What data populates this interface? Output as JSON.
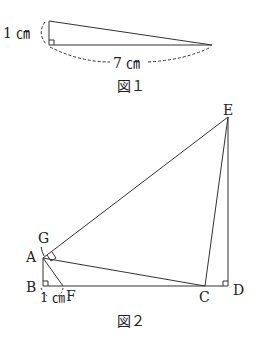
{
  "figure1": {
    "caption": "図１",
    "height_label": "1 ㎝",
    "base_label": "7 ㎝"
  },
  "figure2": {
    "caption": "図２",
    "points": {
      "A": "A",
      "B": "B",
      "C": "C",
      "D": "D",
      "E": "E",
      "F": "F",
      "G": "G"
    },
    "bf_label": "1 ㎝"
  }
}
